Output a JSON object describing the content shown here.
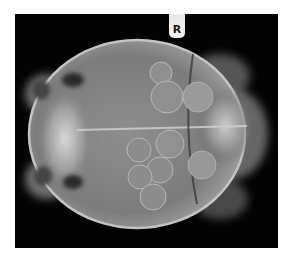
{
  "image": {
    "subject": "radiograph-turtle-dorsoventral-with-eggs",
    "background_color": "#ffffff",
    "film_color": "#030303",
    "bone_color": "#bdbdbd"
  },
  "marker": {
    "label": "R"
  },
  "eggs": [
    {
      "cx": 146,
      "cy": 59,
      "r": 11
    },
    {
      "cx": 152,
      "cy": 83,
      "r": 16
    },
    {
      "cx": 155,
      "cy": 130,
      "r": 14
    },
    {
      "cx": 124,
      "cy": 136,
      "r": 12
    },
    {
      "cx": 145,
      "cy": 156,
      "r": 13
    },
    {
      "cx": 125,
      "cy": 163,
      "r": 12
    },
    {
      "cx": 138,
      "cy": 183,
      "r": 13
    },
    {
      "cx": 183,
      "cy": 83,
      "r": 15
    },
    {
      "cx": 187,
      "cy": 151,
      "r": 14
    }
  ]
}
